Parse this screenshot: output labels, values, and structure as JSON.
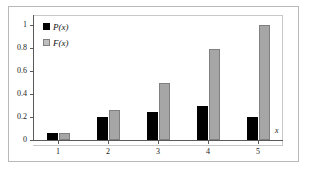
{
  "chart_data": {
    "type": "bar",
    "title": "",
    "subtitle": "",
    "xlabel": "x",
    "ylabel": "",
    "categories": [
      "1",
      "2",
      "3",
      "4",
      "5"
    ],
    "series": [
      {
        "name": "P(x)",
        "color": "#000000",
        "values": [
          0.06,
          0.2,
          0.24,
          0.3,
          0.2
        ]
      },
      {
        "name": "F(x)",
        "color": "#a6a6a6",
        "values": [
          0.06,
          0.26,
          0.5,
          0.79,
          1.0
        ]
      }
    ],
    "ylim": [
      0,
      1
    ],
    "yticks": [
      "0",
      "0.2",
      "0.4",
      "0.6",
      "0.8",
      "1"
    ],
    "ytick_values": [
      0,
      0.2,
      0.4,
      0.6,
      0.8,
      1
    ],
    "xtick_labels": [
      "1",
      "2",
      "3",
      "4",
      "5"
    ],
    "grid": false,
    "legend_position": "top-left",
    "legend": [
      {
        "label": "P(x)",
        "swatch": "black-square"
      },
      {
        "label": "F(x)",
        "swatch": "gray-square"
      }
    ]
  },
  "axis": {
    "x_label_text": "x"
  }
}
